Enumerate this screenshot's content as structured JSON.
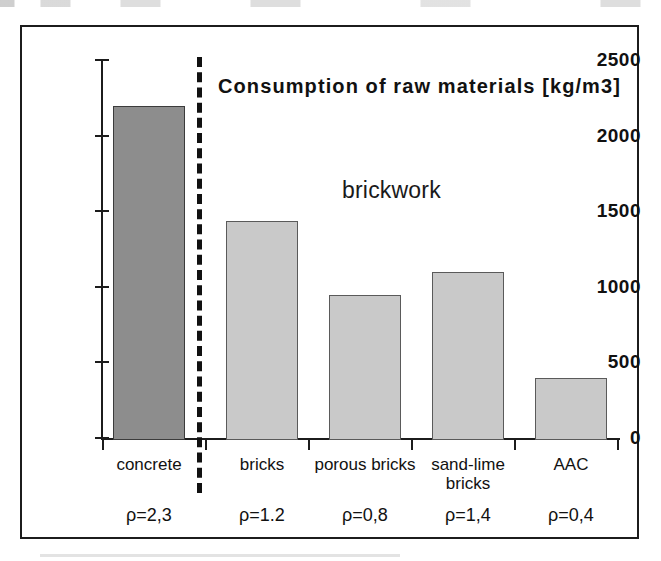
{
  "chart_data": {
    "type": "bar",
    "title": "Consumption of raw materials [kg/m3]",
    "annotation": "brickwork",
    "xlabel": "",
    "ylabel": "",
    "ylim": [
      0,
      2500
    ],
    "grid": false,
    "legend": "none",
    "categories": [
      "concrete",
      "bricks",
      "porous bricks",
      "sand-lime bricks",
      "AAC"
    ],
    "values": [
      2210,
      1450,
      960,
      1110,
      410
    ],
    "ticks": [
      "0",
      "500",
      "1000",
      "1500",
      "2000",
      "2500"
    ],
    "tick_values": [
      0,
      500,
      1000,
      1500,
      2000,
      2500
    ],
    "bars": [
      {
        "category": "concrete",
        "category_line1": "concrete",
        "category_line2": "",
        "value": 2210,
        "density": "ρ=2,3",
        "color": "#8d8d8d",
        "group": "concrete"
      },
      {
        "category": "bricks",
        "category_line1": "bricks",
        "category_line2": "",
        "value": 1450,
        "density": "ρ=1.2",
        "color": "#c9c9c9",
        "group": "brickwork"
      },
      {
        "category": "porous bricks",
        "category_line1": "porous  bricks",
        "category_line2": "",
        "value": 960,
        "density": "ρ=0,8",
        "color": "#c9c9c9",
        "group": "brickwork"
      },
      {
        "category": "sand-lime bricks",
        "category_line1": "sand-lime",
        "category_line2": "bricks",
        "value": 1110,
        "density": "ρ=1,4",
        "color": "#c9c9c9",
        "group": "brickwork"
      },
      {
        "category": "AAC",
        "category_line1": "AAC",
        "category_line2": "",
        "value": 410,
        "density": "ρ=0,4",
        "color": "#c9c9c9",
        "group": "brickwork"
      }
    ],
    "colors": {
      "concrete_bar": "#8d8d8d",
      "brickwork_bar": "#c9c9c9",
      "axis": "#1c1c1c",
      "text": "#111111"
    }
  }
}
